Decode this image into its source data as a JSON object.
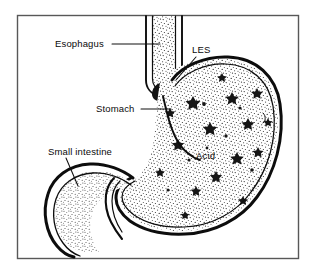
{
  "figure": {
    "background_color": "#ffffff",
    "line_color": "#0d0d0d",
    "frame_color": "#585858",
    "stipple_color": "#2a2a2a"
  },
  "labels": {
    "esophagus": {
      "text": "Esophagus",
      "x": 55,
      "y": 47
    },
    "les": {
      "text": "LES",
      "x": 192,
      "y": 53
    },
    "stomach": {
      "text": "Stomach",
      "x": 96,
      "y": 112
    },
    "small_intestine": {
      "text": "Small intestine",
      "x": 48,
      "y": 155
    },
    "acid": {
      "text": "Acid",
      "x": 196,
      "y": 159
    }
  },
  "structures": {
    "esophagus_name": "esophagus-tube",
    "les_name": "lower-esophageal-sphincter",
    "stomach_name": "stomach-body",
    "acid_name": "stomach-acid-fill",
    "duodenum_name": "small-intestine-duodenum"
  }
}
